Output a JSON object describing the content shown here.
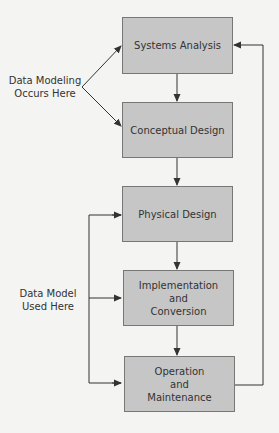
{
  "diagram": {
    "type": "flowchart",
    "colors": {
      "box_fill": "#c6c6c6",
      "box_border": "#777777",
      "line": "#333333",
      "background": "#f4f4f2"
    },
    "boxes": [
      {
        "id": "systems-analysis",
        "lines": [
          "Systems Analysis"
        ]
      },
      {
        "id": "conceptual-design",
        "lines": [
          "Conceptual Design"
        ]
      },
      {
        "id": "physical-design",
        "lines": [
          "Physical Design"
        ]
      },
      {
        "id": "implementation-conversion",
        "lines": [
          "Implementation",
          "and",
          "Conversion"
        ]
      },
      {
        "id": "operation-maintenance",
        "lines": [
          "Operation",
          "and",
          "Maintenance"
        ]
      }
    ],
    "annotations": [
      {
        "id": "data-modeling",
        "lines": [
          "Data Modeling",
          "Occurs Here"
        ],
        "points_to": [
          "systems-analysis",
          "conceptual-design"
        ]
      },
      {
        "id": "data-model-used",
        "lines": [
          "Data Model",
          "Used Here"
        ],
        "points_to": [
          "physical-design",
          "implementation-conversion",
          "operation-maintenance"
        ]
      }
    ],
    "edges": [
      {
        "from": "systems-analysis",
        "to": "conceptual-design"
      },
      {
        "from": "conceptual-design",
        "to": "physical-design"
      },
      {
        "from": "physical-design",
        "to": "implementation-conversion"
      },
      {
        "from": "implementation-conversion",
        "to": "operation-maintenance"
      },
      {
        "from": "operation-maintenance",
        "to": "systems-analysis",
        "kind": "feedback"
      }
    ]
  }
}
